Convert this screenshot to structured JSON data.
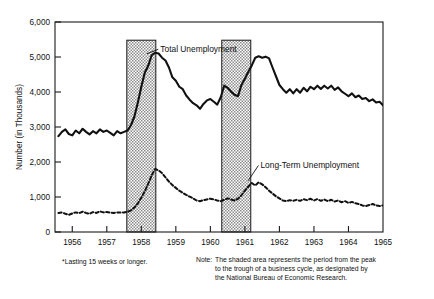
{
  "figure": {
    "footnote": "*Lasting 15 weeks or longer.",
    "note_label": "Note:",
    "note_lines": [
      "The shaded area represents the period from the peak",
      "to the trough of a business cycle, as designated by",
      "the National Bureau of Economic Research."
    ]
  },
  "colors": {
    "ink": "#111111",
    "axis": "#1a1a1a",
    "shading_fill": "#c9c9c9",
    "shading_stroke": "#1a1a1a",
    "background": "#ffffff"
  },
  "chart_data": {
    "type": "line",
    "title": "",
    "xlabel": "",
    "ylabel": "Number (in Thousands)",
    "ylim": [
      0,
      6000
    ],
    "xlim": [
      1955.5,
      1965.0
    ],
    "yticks": [
      0,
      1000,
      2000,
      3000,
      4000,
      5000,
      6000
    ],
    "ytick_labels": [
      "0",
      "1,000",
      "2,000",
      "3,000",
      "4,000",
      "5,000",
      "6,000"
    ],
    "xticks": [
      1956,
      1957,
      1958,
      1959,
      1960,
      1961,
      1962,
      1963,
      1964,
      1965
    ],
    "xtick_labels": [
      "1956",
      "1957",
      "1958",
      "1959",
      "1960",
      "1961",
      "1962",
      "1963",
      "1964",
      "1965"
    ],
    "grid": false,
    "legend_position": "inline-annotations",
    "annotations": [
      {
        "text": "Total Unemployment",
        "x": 1958.55,
        "y": 5150,
        "point_x": 1958.12,
        "point_y": 5050
      },
      {
        "text": "Long-Term Unemployment",
        "x": 1961.45,
        "y": 1830,
        "point_x": 1961.05,
        "point_y": 1420
      }
    ],
    "shaded_regions": [
      {
        "x0": 1957.58,
        "x1": 1958.42,
        "y_top": 5480,
        "label": "recession 1957-1958"
      },
      {
        "x0": 1960.33,
        "x1": 1961.17,
        "y_top": 5480,
        "label": "recession 1960-1961"
      }
    ],
    "series": [
      {
        "name": "Total Unemployment",
        "style": "solid",
        "x": [
          1955.6,
          1955.7,
          1955.8,
          1955.9,
          1956.0,
          1956.1,
          1956.2,
          1956.3,
          1956.4,
          1956.5,
          1956.6,
          1956.7,
          1956.8,
          1956.9,
          1957.0,
          1957.1,
          1957.2,
          1957.3,
          1957.4,
          1957.5,
          1957.6,
          1957.7,
          1957.8,
          1957.9,
          1958.0,
          1958.1,
          1958.2,
          1958.3,
          1958.4,
          1958.5,
          1958.6,
          1958.7,
          1958.8,
          1958.9,
          1959.0,
          1959.1,
          1959.2,
          1959.3,
          1959.4,
          1959.5,
          1959.6,
          1959.7,
          1959.8,
          1959.9,
          1960.0,
          1960.1,
          1960.2,
          1960.3,
          1960.4,
          1960.5,
          1960.6,
          1960.7,
          1960.8,
          1960.9,
          1961.0,
          1961.1,
          1961.2,
          1961.3,
          1961.4,
          1961.5,
          1961.6,
          1961.7,
          1961.8,
          1961.9,
          1962.0,
          1962.1,
          1962.2,
          1962.3,
          1962.4,
          1962.5,
          1962.6,
          1962.7,
          1962.8,
          1962.9,
          1963.0,
          1963.1,
          1963.2,
          1963.3,
          1963.4,
          1963.5,
          1963.6,
          1963.7,
          1963.8,
          1963.9,
          1964.0,
          1964.1,
          1964.2,
          1964.3,
          1964.4,
          1964.5,
          1964.6,
          1964.7,
          1964.8,
          1964.9,
          1965.0
        ],
        "y": [
          2740,
          2860,
          2930,
          2800,
          2760,
          2900,
          2820,
          2950,
          2860,
          2790,
          2880,
          2820,
          2930,
          2860,
          2900,
          2830,
          2760,
          2880,
          2820,
          2860,
          2900,
          3050,
          3300,
          3700,
          4150,
          4550,
          4750,
          5050,
          5120,
          5100,
          4980,
          4900,
          4700,
          4420,
          4320,
          4150,
          4080,
          3900,
          3780,
          3680,
          3620,
          3520,
          3660,
          3760,
          3800,
          3720,
          3640,
          3850,
          4180,
          4120,
          4010,
          3920,
          3880,
          4200,
          4380,
          4580,
          4760,
          4980,
          5020,
          4980,
          5010,
          4960,
          4700,
          4450,
          4200,
          4080,
          3980,
          4080,
          3960,
          4080,
          3980,
          4120,
          4020,
          4150,
          4080,
          4180,
          4090,
          4180,
          4100,
          4180,
          4060,
          4130,
          4020,
          3950,
          3880,
          3960,
          3850,
          3900,
          3800,
          3830,
          3740,
          3790,
          3700,
          3720,
          3620
        ]
      },
      {
        "name": "Long-Term Unemployment",
        "style": "dashed",
        "x": [
          1955.6,
          1955.7,
          1955.8,
          1955.9,
          1956.0,
          1956.1,
          1956.2,
          1956.3,
          1956.4,
          1956.5,
          1956.6,
          1956.7,
          1956.8,
          1956.9,
          1957.0,
          1957.1,
          1957.2,
          1957.3,
          1957.4,
          1957.5,
          1957.6,
          1957.7,
          1957.8,
          1957.9,
          1958.0,
          1958.1,
          1958.2,
          1958.3,
          1958.4,
          1958.5,
          1958.6,
          1958.7,
          1958.8,
          1958.9,
          1959.0,
          1959.1,
          1959.2,
          1959.3,
          1959.4,
          1959.5,
          1959.6,
          1959.7,
          1959.8,
          1959.9,
          1960.0,
          1960.1,
          1960.2,
          1960.3,
          1960.4,
          1960.5,
          1960.6,
          1960.7,
          1960.8,
          1960.9,
          1961.0,
          1961.1,
          1961.2,
          1961.3,
          1961.4,
          1961.5,
          1961.6,
          1961.7,
          1961.8,
          1961.9,
          1962.0,
          1962.1,
          1962.2,
          1962.3,
          1962.4,
          1962.5,
          1962.6,
          1962.7,
          1962.8,
          1962.9,
          1963.0,
          1963.1,
          1963.2,
          1963.3,
          1963.4,
          1963.5,
          1963.6,
          1963.7,
          1963.8,
          1963.9,
          1964.0,
          1964.1,
          1964.2,
          1964.3,
          1964.4,
          1964.5,
          1964.6,
          1964.7,
          1964.8,
          1964.9,
          1965.0
        ],
        "y": [
          540,
          560,
          520,
          490,
          530,
          560,
          540,
          580,
          545,
          520,
          570,
          545,
          590,
          560,
          570,
          550,
          545,
          560,
          555,
          560,
          575,
          620,
          700,
          820,
          980,
          1160,
          1380,
          1620,
          1800,
          1760,
          1680,
          1560,
          1440,
          1340,
          1260,
          1180,
          1120,
          1060,
          1010,
          960,
          900,
          880,
          910,
          930,
          950,
          930,
          900,
          880,
          920,
          960,
          930,
          900,
          950,
          1050,
          1180,
          1300,
          1400,
          1330,
          1420,
          1360,
          1280,
          1180,
          1100,
          1020,
          960,
          900,
          880,
          910,
          890,
          920,
          890,
          940,
          910,
          950,
          900,
          940,
          890,
          930,
          880,
          920,
          870,
          900,
          850,
          880,
          830,
          860,
          820,
          800,
          760,
          740,
          770,
          800,
          760,
          740,
          760
        ]
      }
    ]
  }
}
